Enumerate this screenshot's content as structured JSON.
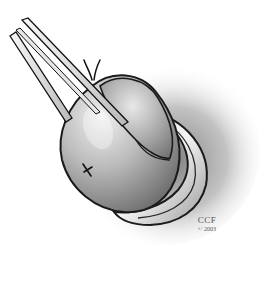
{
  "illustration": {
    "subject": "surgical illustration: forceps grasping rounded tissue with sutured rim",
    "style": "grayscale pencil shading",
    "elements": [
      "forceps",
      "tissue-mass",
      "suture-knot",
      "stitch-mark",
      "everted-rim",
      "background-shadow"
    ]
  },
  "watermark": {
    "line1": "CCF",
    "line2": "© 2003"
  },
  "colors": {
    "background": "#ffffff",
    "shadow": "#9a9a9a",
    "tissue_light": "#e4e4e4",
    "tissue_dark": "#6e6e6e",
    "outline": "#1a1a1a"
  }
}
